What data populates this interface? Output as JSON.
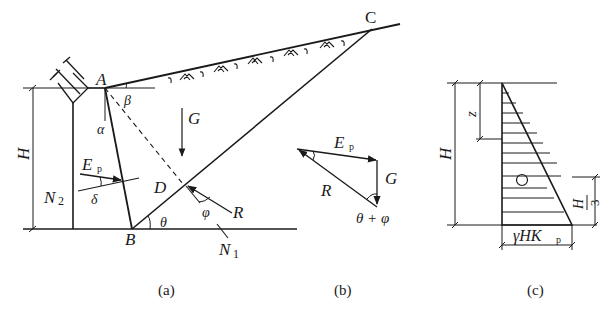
{
  "figure": {
    "panels": [
      {
        "id": "a",
        "caption": "(a)",
        "points": {
          "A": "A",
          "B": "B",
          "C": "C",
          "D": "D"
        },
        "labels": {
          "height": "H",
          "G": "G",
          "Ep": "E",
          "Ep_sub": "p",
          "N2": "N",
          "N2_sub": "2",
          "N1": "N",
          "N1_sub": "1",
          "R": "R",
          "alpha": "α",
          "beta": "β",
          "delta": "δ",
          "theta": "θ",
          "phi": "φ"
        }
      },
      {
        "id": "b",
        "caption": "(b)",
        "labels": {
          "Ep": "E",
          "Ep_sub": "p",
          "G": "G",
          "R": "R",
          "angle": "θ + φ"
        }
      },
      {
        "id": "c",
        "caption": "(c)",
        "labels": {
          "height": "H",
          "depth": "z",
          "third_num": "H",
          "third_den": "3",
          "base": "γHK",
          "base_sub": "p",
          "centroid": "○"
        }
      }
    ],
    "colors": {
      "stroke": "#1a1a1a",
      "background": "#ffffff"
    }
  }
}
